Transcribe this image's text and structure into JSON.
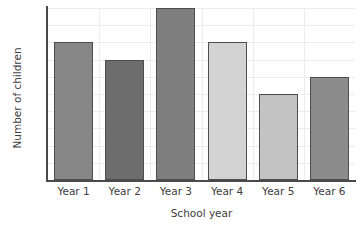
{
  "chart_data": {
    "type": "bar",
    "title": "",
    "xlabel": "School year",
    "ylabel": "Number of children",
    "categories": [
      "Year 1",
      "Year 2",
      "Year 3",
      "Year 4",
      "Year 5",
      "Year 6"
    ],
    "values": [
      80,
      70,
      100,
      80,
      50,
      60
    ],
    "bar_colors": [
      "#868686",
      "#6d6d6d",
      "#7f7f7f",
      "#d3d3d3",
      "#c3c3c3",
      "#8c8c8c"
    ],
    "bar_edge_color": "#4d4d4d",
    "ylim": [
      0,
      100
    ],
    "ytick_step": 10,
    "yticks": [
      0,
      10,
      20,
      30,
      40,
      50,
      60,
      70,
      80,
      90,
      100
    ],
    "ytick_labels": [
      "0",
      "10",
      "20",
      "30",
      "40",
      "50",
      "60",
      "70",
      "80",
      "90",
      "100"
    ],
    "grid": true,
    "grid_color": "#ececec",
    "legend": null,
    "axis_color": "#4a4a4a",
    "background": "#ffffff"
  }
}
